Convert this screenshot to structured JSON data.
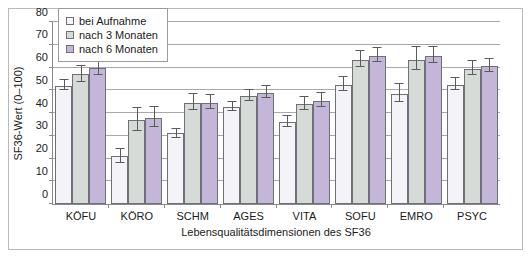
{
  "chart_data": {
    "type": "bar",
    "title": "",
    "xlabel": "Lebensqualitätsdimensionen des SF36",
    "ylabel": "SF36-Wert (0–100)",
    "ylim": [
      0,
      80
    ],
    "ytick_step": 10,
    "yticks": [
      0,
      10,
      20,
      30,
      40,
      50,
      60,
      70,
      80
    ],
    "grid": true,
    "legend_position": "top-left-inside",
    "categories": [
      "KÖFU",
      "KÖRO",
      "SCHM",
      "AGES",
      "VITA",
      "SOFU",
      "EMRO",
      "PSYC"
    ],
    "series": [
      {
        "name": "bei Aufnahme",
        "color": "#f4f3f8",
        "values": [
          52,
          21,
          31,
          42.5,
          36,
          52.5,
          48.5,
          52.5
        ],
        "errors": [
          2,
          3,
          2,
          2,
          2.5,
          3,
          4,
          2.5
        ]
      },
      {
        "name": "nach 3 Monaten",
        "color": "#d7dbd7",
        "values": [
          57,
          37,
          44.5,
          47.5,
          44,
          63.5,
          63.5,
          59.5
        ],
        "errors": [
          3.5,
          5,
          3.5,
          2.5,
          3,
          3.5,
          5,
          3
        ]
      },
      {
        "name": "nach 6 Monaten",
        "color": "#c3b6d8",
        "values": [
          60,
          38,
          44.5,
          49,
          45.5,
          65,
          65,
          60.5
        ],
        "errors": [
          3.5,
          4.5,
          3,
          2.5,
          3,
          3,
          3.5,
          3
        ]
      }
    ]
  },
  "legend": {
    "items": [
      {
        "label": "bei Aufnahme"
      },
      {
        "label": "nach 3 Monaten"
      },
      {
        "label": "nach 6 Monaten"
      }
    ]
  }
}
